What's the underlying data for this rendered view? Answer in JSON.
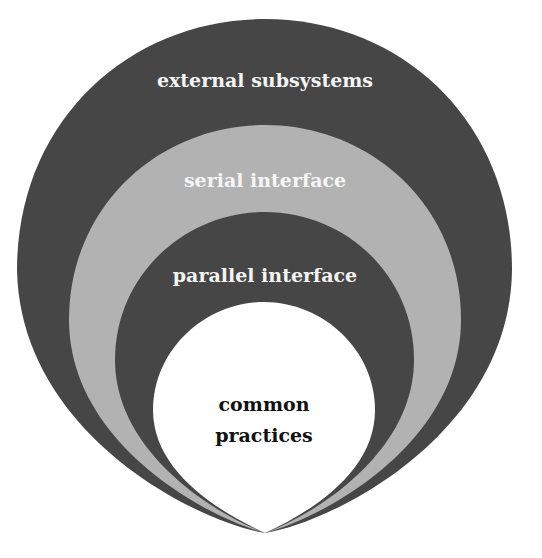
{
  "diagram": {
    "type": "nested-circles",
    "layers": [
      {
        "label": "external subsystems",
        "fill": "#464646",
        "text_color": "#f4f4f4"
      },
      {
        "label": "serial interface",
        "fill": "#b2b2b2",
        "text_color": "#f6f6f6"
      },
      {
        "label": "parallel interface",
        "fill": "#464646",
        "text_color": "#f4f4f4"
      },
      {
        "label": "common practices",
        "label_line1": "common",
        "label_line2": "practices",
        "fill": "#ffffff",
        "text_color": "#111111"
      }
    ]
  }
}
